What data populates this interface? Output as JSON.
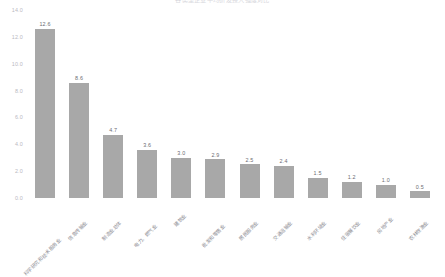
{
  "chart_data": {
    "type": "bar",
    "title": "各类型企业平均研发投入强度对比",
    "xlabel": "",
    "ylabel": "",
    "ylim": [
      0.0,
      14.0
    ],
    "yticks": [
      "0.0",
      "2.0",
      "4.0",
      "6.0",
      "8.0",
      "10.0",
      "12.0",
      "14.0"
    ],
    "ytick_values": [
      0.0,
      2.0,
      4.0,
      6.0,
      8.0,
      10.0,
      12.0,
      14.0
    ],
    "grid": false,
    "legend": false,
    "bar_color": "#a8a8a8",
    "value_label_color": "#6d6d72",
    "axis_text_color": "#b9b9bf",
    "categories": [
      "科学研究和技术服务业",
      "信息传输业",
      "制造业总体",
      "电力、燃气业",
      "建筑业",
      "批发和零售业",
      "居民服务业",
      "交通运输业",
      "水利环境业",
      "住宿餐饮业",
      "房地产业",
      "农林牧渔业"
    ],
    "values": [
      12.6,
      8.6,
      4.7,
      3.6,
      3.0,
      2.9,
      2.5,
      2.4,
      1.5,
      1.2,
      1.0,
      0.5
    ],
    "value_labels": [
      "12.6",
      "8.6",
      "4.7",
      "3.6",
      "3.0",
      "2.9",
      "2.5",
      "2.4",
      "1.5",
      "1.2",
      "1.0",
      "0.5"
    ]
  }
}
